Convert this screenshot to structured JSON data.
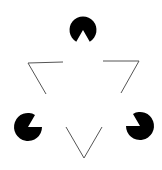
{
  "figure": {
    "background": "#ffffff",
    "ink": "#000000",
    "line_color": "#555555",
    "inducers": [
      {
        "name": "top",
        "cx": 83,
        "cy": 30,
        "r": 13.5,
        "mouth_dir": 90
      },
      {
        "name": "left",
        "cx": 28,
        "cy": 127,
        "r": 14,
        "mouth_dir": -30
      },
      {
        "name": "right",
        "cx": 140,
        "cy": 126,
        "r": 14,
        "mouth_dir": 210
      }
    ],
    "outline_corners": [
      {
        "name": "top-left",
        "points": "63,62 28,63 46,94"
      },
      {
        "name": "top-right",
        "points": "103,61 139,61 121,93"
      },
      {
        "name": "bottom",
        "points": "66,127 84,158 102,127"
      }
    ]
  }
}
